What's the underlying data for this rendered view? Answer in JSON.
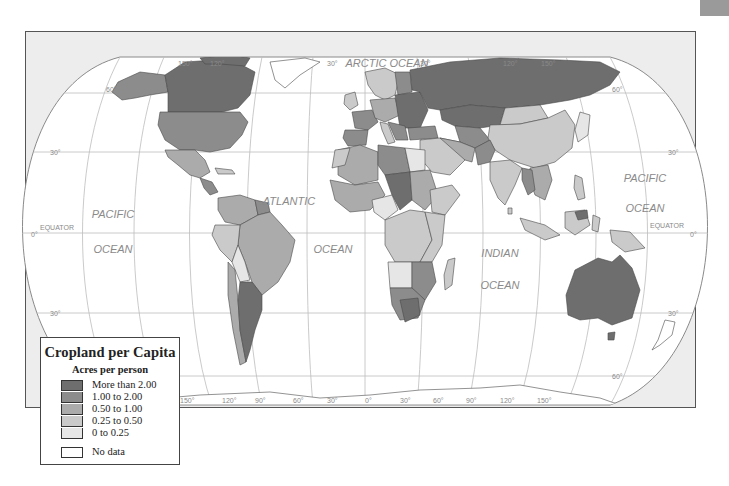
{
  "map": {
    "title": "Cropland per Capita",
    "projection": "Robinson-style world map",
    "ocean_labels": [
      {
        "text": "PACIFIC",
        "x": 113,
        "y": 218
      },
      {
        "text": "OCEAN",
        "x": 113,
        "y": 253
      },
      {
        "text": "ATLANTIC",
        "x": 289,
        "y": 205
      },
      {
        "text": "OCEAN",
        "x": 333,
        "y": 253
      },
      {
        "text": "INDIAN",
        "x": 500,
        "y": 257
      },
      {
        "text": "OCEAN",
        "x": 500,
        "y": 289
      },
      {
        "text": "PACIFIC",
        "x": 645,
        "y": 182
      },
      {
        "text": "OCEAN",
        "x": 645,
        "y": 212
      },
      {
        "text": "ARCTIC OCEAN",
        "x": 387,
        "y": 67
      }
    ],
    "line_labels": {
      "equator_left": "EQUATOR",
      "equator_right": "EQUATOR",
      "lat_30n_left": "30°",
      "lat_30n_right": "30°",
      "lat_0_left": "0°",
      "lat_0_right": "0°",
      "lat_30s_left": "30°",
      "lat_30s_right": "30°",
      "lat_60n_left": "60°",
      "lat_60n_right": "60°",
      "lat_60s_right": "60°"
    },
    "top_longitudes": [
      "150°",
      "120°",
      "30°",
      "30°",
      "120°",
      "150°"
    ],
    "bottom_longitudes": [
      "150°",
      "120°",
      "90°",
      "60°",
      "30°",
      "0°",
      "30°",
      "60°",
      "90°",
      "120°",
      "150°"
    ]
  },
  "legend": {
    "title": "Cropland per Capita",
    "subtitle": "Acres per person",
    "classes": [
      {
        "label": "More than 2.00",
        "color": "#6e6e6e"
      },
      {
        "label": "1.00 to 2.00",
        "color": "#8c8c8c"
      },
      {
        "label": "0.50 to 1.00",
        "color": "#ababab"
      },
      {
        "label": "0.25 to 0.50",
        "color": "#cacaca"
      },
      {
        "label": "0 to 0.25",
        "color": "#e6e6e6"
      }
    ],
    "no_data": {
      "label": "No data",
      "color": "#ffffff"
    }
  },
  "colors": {
    "frame_bg": "#ededed",
    "ocean": "#ffffff",
    "graticule": "#b5b5b5",
    "border": "#4a4a4a",
    "label": "#8a8a8a"
  }
}
